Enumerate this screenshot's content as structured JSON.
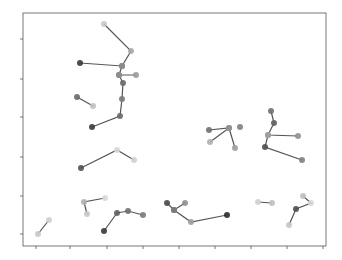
{
  "chart_data": {
    "type": "line",
    "title": "",
    "xlabel": "",
    "ylabel": "",
    "grid": false,
    "legend": null,
    "frame": {
      "left": 23,
      "top": 13,
      "right": 326,
      "bottom": 246
    },
    "x_ticks_px": [
      36,
      70,
      107,
      143,
      179,
      215,
      251,
      287,
      323
    ],
    "y_ticks_px": [
      39,
      79,
      117,
      157,
      196,
      234
    ],
    "line_color": "#555555",
    "series": [
      {
        "name": "cluster-1",
        "points": [
          [
            104,
            24
          ],
          [
            131,
            51
          ],
          [
            122,
            66
          ],
          [
            80,
            63
          ]
        ],
        "shades": [
          "#c8c8c8",
          "#a8a8a8",
          "#8a8a8a",
          "#3a3a3a"
        ]
      },
      {
        "name": "cluster-1b",
        "points": [
          [
            122,
            66
          ],
          [
            119,
            75
          ],
          [
            136,
            75
          ]
        ],
        "shades": [
          "#8a8a8a",
          "#8c8c8c",
          "#9a9a9a"
        ]
      },
      {
        "name": "cluster-1c",
        "points": [
          [
            119,
            75
          ],
          [
            123,
            83
          ],
          [
            122,
            99
          ],
          [
            120,
            116
          ],
          [
            92,
            127
          ]
        ],
        "shades": [
          "#8c8c8c",
          "#6a6a6a",
          "#7a7a7a",
          "#6a6a6a",
          "#3a3a3a"
        ]
      },
      {
        "name": "cluster-2",
        "points": [
          [
            77,
            97
          ],
          [
            93,
            106
          ]
        ],
        "shades": [
          "#6a6a6a",
          "#c0c0c0"
        ]
      },
      {
        "name": "cluster-3",
        "points": [
          [
            81,
            168
          ],
          [
            117,
            150
          ],
          [
            134,
            160
          ]
        ],
        "shades": [
          "#505050",
          "#d8d8d8",
          "#d0d0d0"
        ]
      },
      {
        "name": "cluster-4",
        "points": [
          [
            87,
            214
          ],
          [
            84,
            202
          ],
          [
            105,
            198
          ]
        ],
        "shades": [
          "#c8c8c8",
          "#b0b0b0",
          "#d8d8d8"
        ]
      },
      {
        "name": "cluster-5",
        "points": [
          [
            104,
            231
          ],
          [
            117,
            213
          ],
          [
            128,
            211
          ],
          [
            143,
            215
          ]
        ],
        "shades": [
          "#3a3a3a",
          "#606060",
          "#707070",
          "#7a7a7a"
        ]
      },
      {
        "name": "cluster-6",
        "points": [
          [
            38,
            234
          ],
          [
            49,
            220
          ]
        ],
        "shades": [
          "#c8c8c8",
          "#d0d0d0"
        ]
      },
      {
        "name": "cluster-7",
        "points": [
          [
            209,
            130
          ],
          [
            229,
            128
          ],
          [
            235,
            148
          ]
        ],
        "shades": [
          "#707070",
          "#909090",
          "#a0a0a0"
        ]
      },
      {
        "name": "cluster-7b",
        "points": [
          [
            229,
            128
          ],
          [
            210,
            142
          ]
        ],
        "shades": [
          "#909090",
          "#b0b0b0"
        ]
      },
      {
        "name": "cluster-8",
        "points": [
          [
            240,
            127
          ]
        ],
        "shades": [
          "#808080"
        ]
      },
      {
        "name": "cluster-9",
        "points": [
          [
            271,
            111
          ],
          [
            274,
            123
          ],
          [
            268,
            135
          ],
          [
            298,
            136
          ]
        ],
        "shades": [
          "#707070",
          "#606060",
          "#a0a0a0",
          "#909090"
        ]
      },
      {
        "name": "cluster-9b",
        "points": [
          [
            268,
            135
          ],
          [
            265,
            147
          ],
          [
            302,
            160
          ]
        ],
        "shades": [
          "#a0a0a0",
          "#505050",
          "#808080"
        ]
      },
      {
        "name": "cluster-10",
        "points": [
          [
            167,
            203
          ],
          [
            174,
            210
          ],
          [
            185,
            203
          ]
        ],
        "shades": [
          "#4a4a4a",
          "#7a7a7a",
          "#909090"
        ]
      },
      {
        "name": "cluster-10b",
        "points": [
          [
            174,
            210
          ],
          [
            191,
            222
          ],
          [
            227,
            215
          ]
        ],
        "shades": [
          "#7a7a7a",
          "#a0a0a0",
          "#2a2a2a"
        ]
      },
      {
        "name": "cluster-11",
        "points": [
          [
            258,
            202
          ],
          [
            272,
            203
          ]
        ],
        "shades": [
          "#d0d0d0",
          "#c0c0c0"
        ]
      },
      {
        "name": "cluster-12",
        "points": [
          [
            289,
            225
          ],
          [
            296,
            209
          ],
          [
            311,
            203
          ],
          [
            303,
            196
          ]
        ],
        "shades": [
          "#c8c8c8",
          "#505050",
          "#d8d8d8",
          "#c0c0c0"
        ]
      }
    ]
  }
}
